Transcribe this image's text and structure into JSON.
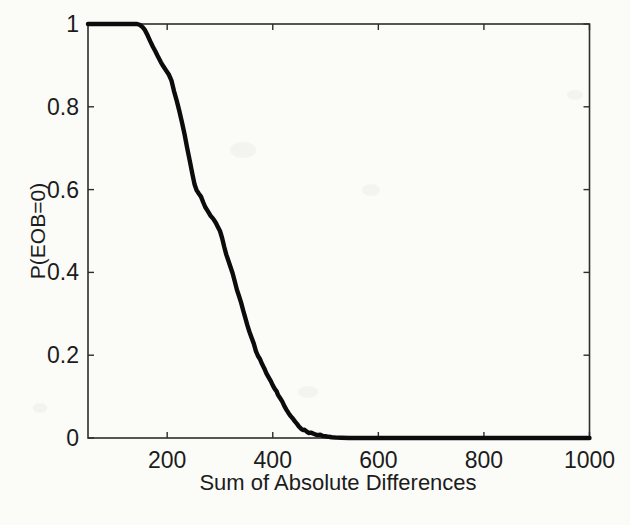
{
  "figure": {
    "background": "#fbfbf8",
    "axis_color": "#2d2d2d",
    "text_color": "#1c1c1c",
    "curve_color": "#0c0c0c"
  },
  "chart_data": {
    "type": "line",
    "title": "",
    "xlabel": "Sum of Absolute Differences",
    "ylabel": "P(EOB=0)",
    "xlim": [
      50,
      1000
    ],
    "ylim": [
      0,
      1
    ],
    "xticks": [
      200,
      400,
      600,
      800,
      1000
    ],
    "xtick_labels": [
      "200",
      "400",
      "600",
      "800",
      "1000"
    ],
    "yticks": [
      0,
      0.2,
      0.4,
      0.6,
      0.8,
      1
    ],
    "ytick_labels": [
      "0",
      "0.2",
      "0.4",
      "0.6",
      "0.8",
      "1"
    ],
    "grid": false,
    "legend_position": "none",
    "box": true,
    "series": [
      {
        "name": "P(EOB=0)",
        "points": [
          [
            50,
            1.0
          ],
          [
            70,
            1.0
          ],
          [
            90,
            1.0
          ],
          [
            110,
            1.0
          ],
          [
            125,
            1.0
          ],
          [
            135,
            1.0
          ],
          [
            143,
            1.0
          ],
          [
            148,
            0.998
          ],
          [
            153,
            0.993
          ],
          [
            158,
            0.985
          ],
          [
            163,
            0.972
          ],
          [
            168,
            0.958
          ],
          [
            173,
            0.945
          ],
          [
            178,
            0.933
          ],
          [
            183,
            0.92
          ],
          [
            188,
            0.908
          ],
          [
            193,
            0.897
          ],
          [
            198,
            0.888
          ],
          [
            203,
            0.878
          ],
          [
            208,
            0.864
          ],
          [
            213,
            0.838
          ],
          [
            218,
            0.815
          ],
          [
            223,
            0.79
          ],
          [
            228,
            0.762
          ],
          [
            233,
            0.733
          ],
          [
            238,
            0.7
          ],
          [
            243,
            0.668
          ],
          [
            248,
            0.636
          ],
          [
            252,
            0.612
          ],
          [
            256,
            0.598
          ],
          [
            260,
            0.59
          ],
          [
            264,
            0.583
          ],
          [
            268,
            0.57
          ],
          [
            272,
            0.558
          ],
          [
            277,
            0.548
          ],
          [
            282,
            0.537
          ],
          [
            287,
            0.53
          ],
          [
            292,
            0.52
          ],
          [
            296,
            0.51
          ],
          [
            300,
            0.5
          ],
          [
            304,
            0.483
          ],
          [
            308,
            0.462
          ],
          [
            312,
            0.443
          ],
          [
            316,
            0.428
          ],
          [
            320,
            0.413
          ],
          [
            324,
            0.398
          ],
          [
            328,
            0.378
          ],
          [
            332,
            0.358
          ],
          [
            336,
            0.343
          ],
          [
            340,
            0.327
          ],
          [
            344,
            0.308
          ],
          [
            348,
            0.29
          ],
          [
            352,
            0.272
          ],
          [
            356,
            0.256
          ],
          [
            360,
            0.242
          ],
          [
            364,
            0.228
          ],
          [
            368,
            0.21
          ],
          [
            372,
            0.198
          ],
          [
            376,
            0.19
          ],
          [
            380,
            0.178
          ],
          [
            384,
            0.168
          ],
          [
            388,
            0.156
          ],
          [
            392,
            0.147
          ],
          [
            396,
            0.138
          ],
          [
            400,
            0.127
          ],
          [
            404,
            0.118
          ],
          [
            407,
            0.113
          ],
          [
            410,
            0.104
          ],
          [
            414,
            0.096
          ],
          [
            418,
            0.088
          ],
          [
            422,
            0.077
          ],
          [
            426,
            0.068
          ],
          [
            430,
            0.06
          ],
          [
            434,
            0.053
          ],
          [
            438,
            0.047
          ],
          [
            442,
            0.04
          ],
          [
            446,
            0.034
          ],
          [
            450,
            0.027
          ],
          [
            454,
            0.022
          ],
          [
            457,
            0.019
          ],
          [
            460,
            0.02
          ],
          [
            464,
            0.016
          ],
          [
            468,
            0.012
          ],
          [
            472,
            0.013
          ],
          [
            476,
            0.011
          ],
          [
            480,
            0.009
          ],
          [
            485,
            0.007
          ],
          [
            490,
            0.008
          ],
          [
            495,
            0.005
          ],
          [
            500,
            0.004
          ],
          [
            506,
            0.003
          ],
          [
            512,
            0.002
          ],
          [
            520,
            0.001
          ],
          [
            530,
            0.0005
          ],
          [
            545,
            0
          ],
          [
            570,
            0
          ],
          [
            600,
            0
          ],
          [
            650,
            0
          ],
          [
            700,
            0
          ],
          [
            750,
            0
          ],
          [
            800,
            0
          ],
          [
            850,
            0
          ],
          [
            900,
            0
          ],
          [
            950,
            0
          ],
          [
            1000,
            0
          ]
        ]
      }
    ]
  }
}
